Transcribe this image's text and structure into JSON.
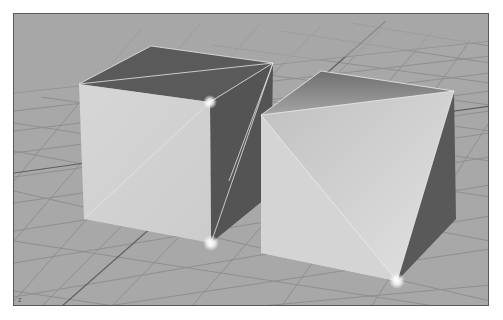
{
  "viewport": {
    "name": "perspective-viewport",
    "background_color": "#a9a9a9",
    "grid_color": "#8e8e8e",
    "axis_indicator": "z",
    "objects": [
      {
        "name": "cube-left",
        "faces": {
          "top": {
            "color": "#5b5b5b"
          },
          "front": {
            "color": "#d2d2d2"
          },
          "side": {
            "color": "#555555"
          }
        },
        "highlighted_vertices": 2
      },
      {
        "name": "cube-right",
        "faces": {
          "top": {
            "color": "#8a8a8a"
          },
          "front": {
            "color": "#c8c8c8"
          },
          "side": {
            "color": "#5a5a5a"
          }
        },
        "highlighted_vertices": 1
      }
    ]
  }
}
